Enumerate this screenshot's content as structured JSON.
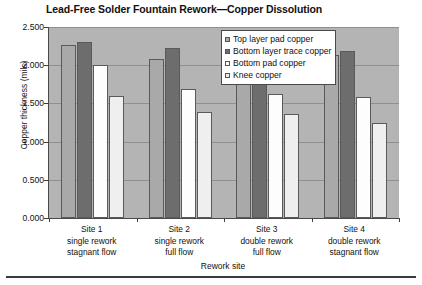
{
  "chart_data": {
    "type": "bar",
    "title": "Lead-Free Solder Fountain Rework—Copper Dissolution",
    "xlabel": "Rework site",
    "ylabel": "Copper thickness (mils)",
    "ylim": [
      0.0,
      2.5
    ],
    "ytick_labels": [
      "2.500",
      "2.000",
      "1.500",
      "1.000",
      "0.500",
      "0.000"
    ],
    "ytick_values": [
      2.5,
      2.0,
      1.5,
      1.0,
      0.5,
      0.0
    ],
    "grid": true,
    "legend_position": "top-right inside plot",
    "categories": [
      {
        "line1": "Site 1",
        "line2": "single rework",
        "line3": "stagnant flow"
      },
      {
        "line1": "Site 2",
        "line2": "single rework",
        "line3": "full flow"
      },
      {
        "line1": "Site 3",
        "line2": "double rework",
        "line3": "full flow"
      },
      {
        "line1": "Site 4",
        "line2": "double rework",
        "line3": "stagnant flow"
      }
    ],
    "series": [
      {
        "name": "Top layer pad copper",
        "color": "#a9a9a9",
        "values": [
          2.27,
          2.08,
          2.08,
          2.14
        ]
      },
      {
        "name": "Bottom layer trace copper",
        "color": "#6d6d6d",
        "values": [
          2.3,
          2.22,
          2.25,
          2.18
        ]
      },
      {
        "name": "Bottom pad copper",
        "color": "#fdfdfd",
        "values": [
          2.0,
          1.69,
          1.62,
          1.58
        ]
      },
      {
        "name": "Knee copper",
        "color": "#efefef",
        "values": [
          1.6,
          1.39,
          1.36,
          1.24
        ]
      }
    ]
  }
}
